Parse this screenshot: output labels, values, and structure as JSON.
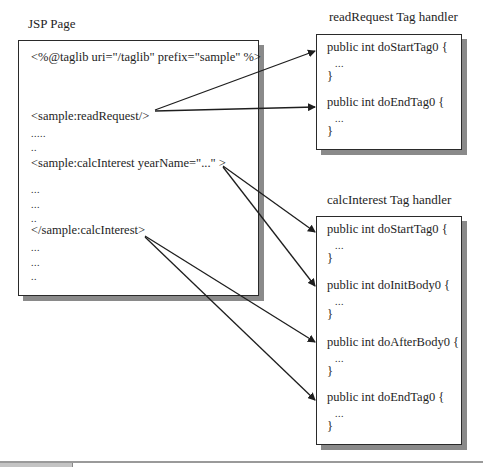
{
  "jsp": {
    "title": "JSP Page",
    "lines": [
      "<%@taglib uri=\"/taglib\" prefix=\"sample\" %>",
      "<sample:readRequest/>",
      ".....",
      "..",
      "<sample:calcInterest yearName=\"...\" >",
      "...",
      "...",
      "..",
      "</sample:calcInterest>",
      "...",
      "...",
      ".."
    ]
  },
  "readRequest": {
    "title": "readRequest Tag handler",
    "methods": [
      {
        "signature": "public int doStartTag0 {",
        "body": "...",
        "close": "}"
      },
      {
        "signature": "public int doEndTag0 {",
        "body": "...",
        "close": "}"
      }
    ]
  },
  "calcInterest": {
    "title": "calcInterest Tag handler",
    "methods": [
      {
        "signature": "public int doStartTag0 {",
        "body": "...",
        "close": "}"
      },
      {
        "signature": "public int doInitBody0 {",
        "body": "...",
        "close": "}"
      },
      {
        "signature": "public int doAfterBody0 {",
        "body": "...",
        "close": "}"
      },
      {
        "signature": "public int doEndTag0 {",
        "body": "...",
        "close": "}"
      }
    ]
  },
  "colors": {
    "line": "#1e1e1e",
    "shadow": "#8a8a8a",
    "border": "#2a2a2a"
  }
}
